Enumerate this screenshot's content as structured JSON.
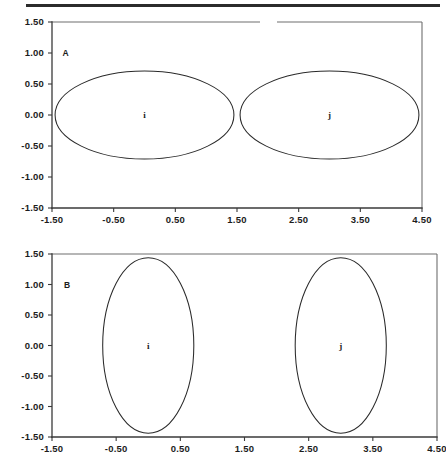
{
  "figure": {
    "background_color": "#ffffff",
    "line_color": "#2a2a2a",
    "axis_color": "#3a3a3a",
    "top_rule": "page-separator-rule"
  },
  "panels": [
    {
      "id": "A",
      "label": "A",
      "label_x": 0.75,
      "label_y": 1.0
    },
    {
      "id": "B",
      "label": "B",
      "label_x": 0.85,
      "label_y": 1.0
    }
  ],
  "chart_data": [
    {
      "type": "scatter",
      "panel": "A",
      "title": "",
      "subtitle": "",
      "xlabel": "",
      "ylabel": "",
      "xlim": [
        -1.5,
        4.5
      ],
      "ylim": [
        -1.5,
        1.5
      ],
      "xticks": [
        -1.5,
        -0.5,
        0.5,
        1.5,
        2.5,
        3.5,
        4.5
      ],
      "xticklabels": [
        "-1.50",
        "-0.50",
        "0.50",
        "1.50",
        "2.50",
        "3.50",
        "4.50"
      ],
      "yticks": [
        -1.5,
        -1.0,
        -0.5,
        0.0,
        0.5,
        1.0,
        1.5
      ],
      "yticklabels": [
        "-1.50",
        "-1.00",
        "-0.50",
        "0.00",
        "0.50",
        "1.00",
        "1.50"
      ],
      "grid": false,
      "legend": "none",
      "annotations": [
        "A",
        "i",
        "j"
      ],
      "shapes": [
        {
          "kind": "ellipse",
          "label": "i",
          "cx": 0.0,
          "cy": 0.0,
          "rx": 1.45,
          "ry": 0.71,
          "rotation": 0
        },
        {
          "kind": "ellipse",
          "label": "j",
          "cx": 3.0,
          "cy": 0.0,
          "rx": 1.45,
          "ry": 0.71,
          "rotation": 0
        }
      ]
    },
    {
      "type": "scatter",
      "panel": "B",
      "title": "",
      "subtitle": "",
      "xlabel": "",
      "ylabel": "",
      "xlim": [
        -1.5,
        4.5
      ],
      "ylim": [
        -1.5,
        1.5
      ],
      "xticks": [
        -1.5,
        -0.5,
        0.5,
        1.5,
        2.5,
        3.5,
        4.5
      ],
      "xticklabels": [
        "-1.50",
        "-0.50",
        "0.50",
        "1.50",
        "2.50",
        "3.50",
        "4.50"
      ],
      "yticks": [
        -1.5,
        -1.0,
        -0.5,
        0.0,
        0.5,
        1.0,
        1.5
      ],
      "yticklabels": [
        "-1.50",
        "-1.00",
        "-0.50",
        "0.00",
        "0.50",
        "1.00",
        "1.50"
      ],
      "grid": false,
      "legend": "none",
      "annotations": [
        "B",
        "i",
        "j"
      ],
      "shapes": [
        {
          "kind": "ellipse",
          "label": "i",
          "cx": 0.0,
          "cy": 0.0,
          "rx": 0.71,
          "ry": 1.44,
          "rotation": 0
        },
        {
          "kind": "ellipse",
          "label": "j",
          "cx": 3.0,
          "cy": 0.0,
          "rx": 0.71,
          "ry": 1.44,
          "rotation": 0
        }
      ]
    }
  ]
}
